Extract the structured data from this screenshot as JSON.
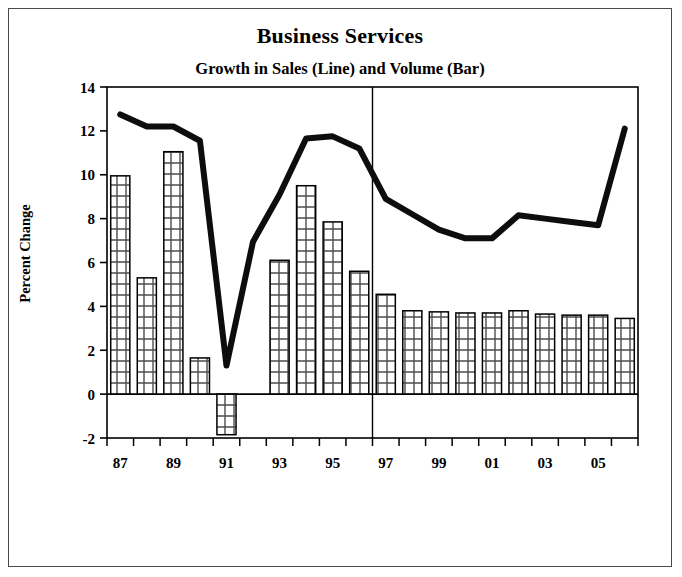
{
  "chart_data": {
    "type": "bar",
    "title": "Business Services",
    "subtitle": "Growth in Sales (Line) and Volume (Bar)",
    "xlabel": "",
    "ylabel": "Percent Change",
    "ylim": [
      -2,
      14
    ],
    "ytick_step": 2,
    "yticks": [
      "14",
      "12",
      "10",
      "8",
      "6",
      "4",
      "2",
      "0",
      "-2"
    ],
    "grid": false,
    "legend": "none (encoded in subtitle: Line = Sales, Bar = Volume)",
    "categories": [
      "87",
      "88",
      "89",
      "90",
      "91",
      "92",
      "93",
      "94",
      "95",
      "96",
      "97",
      "98",
      "99",
      "00",
      "01",
      "02",
      "03",
      "04",
      "05",
      "06"
    ],
    "xtick_labels": [
      "87",
      "89",
      "91",
      "93",
      "95",
      "97",
      "99",
      "01",
      "03",
      "05"
    ],
    "xtick_label_years": [
      "87",
      "89",
      "91",
      "93",
      "95",
      "97",
      "99",
      "01",
      "03",
      "05"
    ],
    "annotations": [
      {
        "type": "vertical-divider",
        "at_category": "96.5",
        "note": "separates history from projection"
      }
    ],
    "series": [
      {
        "name": "Volume (Bar)",
        "render": "bar",
        "fill": "crosshatch",
        "values": [
          9.95,
          5.3,
          11.05,
          1.65,
          -1.85,
          0,
          6.1,
          9.5,
          7.85,
          5.6,
          4.55,
          3.8,
          3.75,
          3.7,
          3.7,
          3.8,
          3.65,
          3.6,
          3.6,
          3.45
        ]
      },
      {
        "name": "Sales (Line)",
        "render": "line",
        "values": [
          12.75,
          12.2,
          12.2,
          11.55,
          1.3,
          6.95,
          9.1,
          11.65,
          11.75,
          11.2,
          8.9,
          8.2,
          7.5,
          7.1,
          7.1,
          8.15,
          8.0,
          7.85,
          7.7,
          12.1
        ]
      }
    ]
  },
  "colors": {
    "ink": "#000000",
    "frame": "#4a4a4a",
    "bar_edge": "#1a1a1a",
    "bar_hatch": "#555555",
    "line": "#111111"
  }
}
